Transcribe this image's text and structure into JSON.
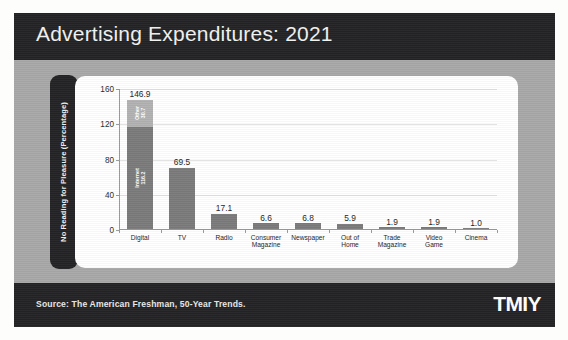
{
  "slide": {
    "title": "Advertising Expenditures: 2021",
    "source": "Source: The American Freshman, 50-Year Trends.",
    "logo": "TMIY"
  },
  "colors": {
    "frame_dark": "#232325",
    "slide_bg": "#a8a8a8",
    "panel_bg": "#ffffff",
    "bar_main": "#7b7b7b",
    "bar_top_segment": "#b2b2b2",
    "gridline": "#e2e2e2"
  },
  "chart_data": {
    "type": "bar",
    "title": "",
    "xlabel": "",
    "ylabel": "No Reading for Pleasure (Percentage)",
    "ylim": [
      0,
      160
    ],
    "yticks": [
      0,
      40,
      80,
      120,
      160
    ],
    "grid": true,
    "legend": "none",
    "categories": [
      "Digital",
      "TV",
      "Radio",
      "Consumer Magazine",
      "Newspaper",
      "Out of Home",
      "Trade Magazine",
      "Video Game",
      "Cinema"
    ],
    "category_lines": [
      [
        "Digital"
      ],
      [
        "TV"
      ],
      [
        "Radio"
      ],
      [
        "Consumer",
        "Magazine"
      ],
      [
        "Newspaper"
      ],
      [
        "Out of",
        "Home"
      ],
      [
        "Trade",
        "Magazine"
      ],
      [
        "Video",
        "Game"
      ],
      [
        "Cinema"
      ]
    ],
    "values": [
      146.9,
      69.5,
      17.1,
      6.6,
      6.8,
      5.9,
      1.9,
      1.9,
      1.0
    ],
    "value_labels": [
      "146.9",
      "69.5",
      "17.1",
      "6.6",
      "6.8",
      "5.9",
      "1.9",
      "1.9",
      "1.0"
    ],
    "stacked_first_bar": {
      "segments": [
        {
          "name": "Internet",
          "value": 116.2,
          "label": "Internet",
          "value_label": "116.2"
        },
        {
          "name": "Other",
          "value": 30.7,
          "label": "Other",
          "value_label": "30.7"
        }
      ],
      "total": 146.9
    }
  }
}
